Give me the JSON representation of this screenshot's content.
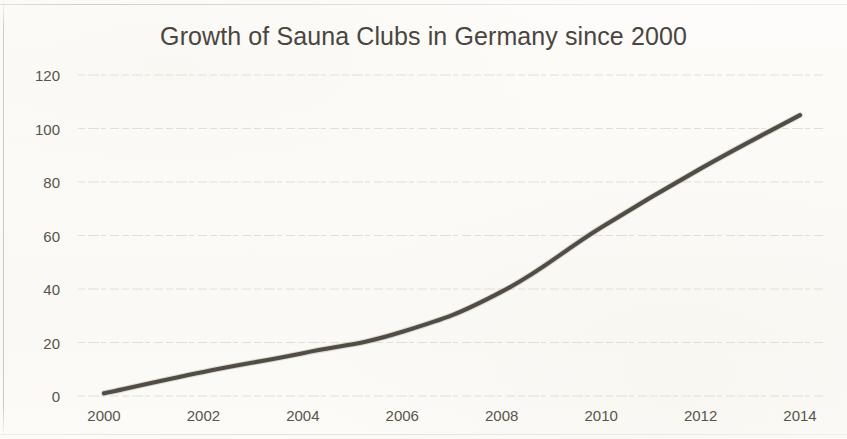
{
  "chart_data": {
    "type": "line",
    "title": "Growth of Sauna Clubs in Germany since 2000",
    "xlabel": "",
    "ylabel": "",
    "x": [
      2000,
      2002,
      2004,
      2006,
      2008,
      2010,
      2012,
      2014
    ],
    "values": [
      1,
      9,
      16,
      24,
      39,
      63,
      85,
      105
    ],
    "series": [
      {
        "name": "Sauna Clubs",
        "values": [
          1,
          9,
          16,
          24,
          39,
          63,
          85,
          105
        ]
      }
    ],
    "xticklabels": [
      "2000",
      "2002",
      "2004",
      "2006",
      "2008",
      "2010",
      "2012",
      "2014"
    ],
    "yticklabels": [
      "0",
      "20",
      "40",
      "60",
      "80",
      "100",
      "120"
    ],
    "yticks": [
      0,
      20,
      40,
      60,
      80,
      100,
      120
    ],
    "xlim": [
      2000,
      2014
    ],
    "ylim": [
      0,
      120
    ],
    "grid": "horizontal",
    "legend": "none",
    "line_color": "#514c44",
    "grid_color": "#dedbd4",
    "background_color": "#fbfaf7",
    "text_color": "#4a463f"
  }
}
